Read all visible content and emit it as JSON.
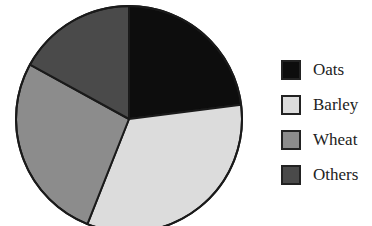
{
  "chart_data": {
    "type": "pie",
    "title": "",
    "categories": [
      "Oats",
      "Barley",
      "Wheat",
      "Others"
    ],
    "values": [
      23,
      33,
      27,
      17
    ],
    "unit": "%",
    "start_angle_deg": 0,
    "direction": "clockwise",
    "colors": [
      "#0d0d0d",
      "#dcdcdc",
      "#8c8c8c",
      "#4a4a4a"
    ],
    "legend_position": "right"
  },
  "legend": {
    "items": [
      {
        "label": "Oats",
        "color": "#0d0d0d"
      },
      {
        "label": "Barley",
        "color": "#dcdcdc"
      },
      {
        "label": "Wheat",
        "color": "#8c8c8c"
      },
      {
        "label": "Others",
        "color": "#4a4a4a"
      }
    ]
  }
}
